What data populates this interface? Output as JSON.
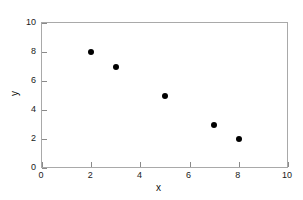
{
  "chart_data": {
    "type": "scatter",
    "title": "",
    "xlabel": "x",
    "ylabel": "y",
    "xlim": [
      0,
      10
    ],
    "ylim": [
      0,
      10
    ],
    "xticks": [
      0,
      2,
      4,
      6,
      8,
      10
    ],
    "yticks": [
      0,
      2,
      4,
      6,
      8,
      10
    ],
    "xtick_labels": [
      "0",
      "2",
      "4",
      "6",
      "8",
      "10"
    ],
    "ytick_labels": [
      "0",
      "2",
      "4",
      "6",
      "8",
      "10"
    ],
    "grid": false,
    "legend": null,
    "series": [
      {
        "name": "series-1",
        "marker": "filled-circle",
        "color": "#000000",
        "x": [
          2,
          3,
          5,
          7,
          8
        ],
        "y": [
          8,
          7,
          5,
          3,
          2
        ],
        "points": [
          {
            "x": 2,
            "y": 8
          },
          {
            "x": 3,
            "y": 7
          },
          {
            "x": 5,
            "y": 5
          },
          {
            "x": 7,
            "y": 3
          },
          {
            "x": 8,
            "y": 2
          }
        ]
      }
    ]
  },
  "figure": {
    "background_color": "#ffffff",
    "axis_color": "#a9a9a9",
    "tick_color": "#8a8a8a",
    "text_color": "#111111"
  }
}
